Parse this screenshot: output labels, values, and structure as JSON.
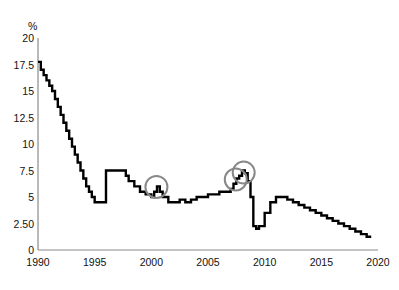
{
  "chart_title": "",
  "axes": {
    "unit_label": "%",
    "y_ticks": [
      "0",
      "2.50",
      "5",
      "7.5",
      "10",
      "12.5",
      "15",
      "17.5",
      "20"
    ],
    "y_tick_values": [
      0,
      2.5,
      5,
      7.5,
      10,
      12.5,
      15,
      17.5,
      20
    ],
    "x_ticks": [
      "1990",
      "1995",
      "2000",
      "2005",
      "2010",
      "2015",
      "2020"
    ],
    "x_tick_values": [
      1990,
      1995,
      2000,
      2005,
      2010,
      2015,
      2020
    ]
  },
  "style": {
    "line_color": "#000000",
    "circle_color": "#888888",
    "axis_color": "#888888",
    "text_color": "#111111"
  },
  "chart_data": {
    "type": "line",
    "title": "",
    "xlabel": "",
    "ylabel": "%",
    "xlim": [
      1990,
      2020
    ],
    "ylim": [
      0,
      20
    ],
    "grid": false,
    "legend": null,
    "step": "post",
    "series": [
      {
        "name": "Rate",
        "x": [
          1990.0,
          1990.25,
          1990.5,
          1990.75,
          1991.0,
          1991.25,
          1991.5,
          1991.75,
          1992.0,
          1992.25,
          1992.5,
          1992.75,
          1993.0,
          1993.25,
          1993.5,
          1993.75,
          1994.0,
          1994.25,
          1994.5,
          1994.75,
          1995.0,
          1995.25,
          1995.5,
          1996.0,
          1996.5,
          1997.0,
          1997.5,
          1997.75,
          1998.0,
          1998.5,
          1999.0,
          1999.5,
          2000.0,
          2000.25,
          2000.5,
          2000.75,
          2001.0,
          2001.5,
          2002.0,
          2002.5,
          2003.0,
          2003.5,
          2004.0,
          2004.5,
          2005.0,
          2005.5,
          2006.0,
          2006.5,
          2007.0,
          2007.25,
          2007.5,
          2007.75,
          2008.0,
          2008.25,
          2008.5,
          2008.75,
          2009.0,
          2009.25,
          2009.5,
          2010.0,
          2010.5,
          2011.0,
          2011.5,
          2012.0,
          2012.5,
          2013.0,
          2013.5,
          2014.0,
          2014.5,
          2015.0,
          2015.5,
          2016.0,
          2016.5,
          2017.0,
          2017.5,
          2018.0,
          2018.5,
          2019.0,
          2019.4
        ],
        "y": [
          17.75,
          17.0,
          16.5,
          16.0,
          15.5,
          15.0,
          14.25,
          13.5,
          12.75,
          12.0,
          11.25,
          10.5,
          9.75,
          9.0,
          8.25,
          7.5,
          6.75,
          6.0,
          5.5,
          5.0,
          4.5,
          4.5,
          4.5,
          7.5,
          7.5,
          7.5,
          7.5,
          7.0,
          6.5,
          6.0,
          5.5,
          5.25,
          5.0,
          5.5,
          6.0,
          5.5,
          5.0,
          4.5,
          4.5,
          4.75,
          4.5,
          4.75,
          5.0,
          5.0,
          5.25,
          5.25,
          5.5,
          5.5,
          5.75,
          6.25,
          6.75,
          7.0,
          7.5,
          7.25,
          6.5,
          5.0,
          2.25,
          2.0,
          2.25,
          3.5,
          4.5,
          5.0,
          5.0,
          4.75,
          4.5,
          4.25,
          4.0,
          3.75,
          3.5,
          3.25,
          3.0,
          2.75,
          2.5,
          2.25,
          2.0,
          1.75,
          1.5,
          1.25,
          1.25
        ],
        "color": "#000000"
      }
    ],
    "annotations": [
      {
        "type": "circle",
        "name": "highlight-circle-2000",
        "x": 2000.45,
        "y": 5.95,
        "r_px": 11
      },
      {
        "type": "circle",
        "name": "highlight-circle-2007",
        "x": 2007.45,
        "y": 6.65,
        "r_px": 11
      },
      {
        "type": "circle",
        "name": "highlight-circle-2008",
        "x": 2008.15,
        "y": 7.3,
        "r_px": 11
      }
    ]
  }
}
